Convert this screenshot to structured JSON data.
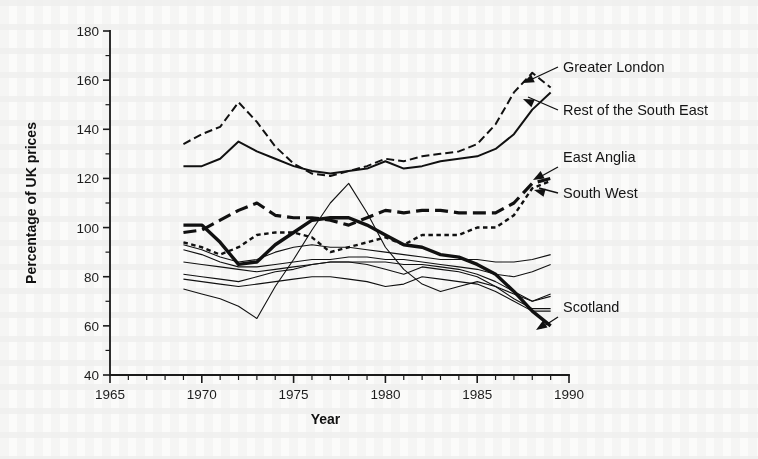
{
  "figure": {
    "background_color": "#fbfbfa",
    "ink_color": "#111111"
  },
  "axes": {
    "x_title": "Year",
    "y_title": "Percentage of UK prices",
    "x_tick_labels": [
      "1965",
      "1970",
      "1975",
      "1980",
      "1985",
      "1990"
    ],
    "y_tick_labels": [
      "40",
      "60",
      "80",
      "100",
      "120",
      "140",
      "160",
      "180"
    ]
  },
  "annotations": [
    {
      "id": "greater-london",
      "text": "Greater London"
    },
    {
      "id": "rest-of-the-south-east",
      "text": "Rest of the South East"
    },
    {
      "id": "east-anglia",
      "text": "East Anglia"
    },
    {
      "id": "south-west",
      "text": "South West"
    },
    {
      "id": "scotland",
      "text": "Scotland"
    }
  ],
  "chart_data": {
    "type": "line",
    "title": "",
    "xlabel": "Year",
    "ylabel": "Percentage of UK prices",
    "xlim": [
      1965,
      1990
    ],
    "ylim": [
      40,
      180
    ],
    "x_major_ticks": [
      1965,
      1970,
      1975,
      1980,
      1985,
      1990
    ],
    "x_minor_tick_step": 1,
    "y_major_ticks": [
      40,
      60,
      80,
      100,
      120,
      140,
      160,
      180
    ],
    "y_minor_tick_step": 10,
    "grid": false,
    "legend": "inline-annotations-right",
    "x": [
      1969,
      1970,
      1971,
      1972,
      1973,
      1974,
      1975,
      1976,
      1977,
      1978,
      1979,
      1980,
      1981,
      1982,
      1983,
      1984,
      1985,
      1986,
      1987,
      1988,
      1989
    ],
    "series": [
      {
        "name": "Greater London",
        "style": "dashed",
        "width": 2.0,
        "labelled": true,
        "values": [
          134,
          138,
          141,
          151,
          143,
          133,
          126,
          122,
          121,
          123,
          125,
          128,
          127,
          129,
          130,
          131,
          134,
          142,
          155,
          163,
          157
        ]
      },
      {
        "name": "Rest of the South East",
        "style": "solid",
        "width": 2.0,
        "labelled": true,
        "values": [
          125,
          125,
          128,
          135,
          131,
          128,
          125,
          123,
          122,
          123,
          124,
          127,
          124,
          125,
          127,
          128,
          129,
          132,
          138,
          148,
          155
        ]
      },
      {
        "name": "East Anglia",
        "style": "long-dash",
        "width": 3.2,
        "labelled": true,
        "values": [
          98,
          99,
          103,
          107,
          110,
          105,
          104,
          104,
          103,
          101,
          104,
          107,
          106,
          107,
          107,
          106,
          106,
          106,
          110,
          118,
          120
        ]
      },
      {
        "name": "South West",
        "style": "short-dash",
        "width": 2.4,
        "labelled": true,
        "values": [
          94,
          92,
          89,
          92,
          97,
          98,
          98,
          96,
          90,
          92,
          94,
          96,
          93,
          97,
          97,
          97,
          100,
          100,
          105,
          116,
          119
        ]
      },
      {
        "name": "Scotland",
        "style": "solid",
        "width": 3.4,
        "labelled": true,
        "values": [
          101,
          101,
          94,
          85,
          86,
          93,
          98,
          103,
          104,
          104,
          101,
          97,
          93,
          92,
          89,
          88,
          85,
          81,
          74,
          66,
          60
        ]
      },
      {
        "name": "unlabelled-1",
        "style": "solid",
        "width": 1.1,
        "labelled": false,
        "values": [
          93,
          91,
          88,
          86,
          87,
          90,
          92,
          93,
          92,
          92,
          91,
          90,
          89,
          88,
          87,
          87,
          87,
          86,
          86,
          87,
          89
        ]
      },
      {
        "name": "unlabelled-2",
        "style": "solid",
        "width": 1.1,
        "labelled": false,
        "values": [
          91,
          89,
          86,
          84,
          84,
          85,
          86,
          87,
          87,
          88,
          88,
          87,
          87,
          86,
          85,
          84,
          83,
          81,
          80,
          82,
          85
        ]
      },
      {
        "name": "unlabelled-3",
        "style": "solid",
        "width": 1.1,
        "labelled": false,
        "values": [
          86,
          85,
          84,
          83,
          82,
          83,
          84,
          85,
          86,
          86,
          86,
          86,
          85,
          85,
          84,
          83,
          81,
          78,
          74,
          70,
          72
        ]
      },
      {
        "name": "unlabelled-4",
        "style": "solid",
        "width": 1.1,
        "labelled": false,
        "values": [
          81,
          80,
          79,
          78,
          80,
          82,
          83,
          85,
          86,
          86,
          85,
          83,
          81,
          84,
          83,
          82,
          80,
          76,
          71,
          67,
          67
        ]
      },
      {
        "name": "unlabelled-5",
        "style": "solid",
        "width": 1.1,
        "labelled": false,
        "values": [
          79,
          78,
          77,
          76,
          77,
          78,
          79,
          80,
          80,
          79,
          78,
          76,
          77,
          80,
          79,
          78,
          77,
          74,
          70,
          66,
          66
        ]
      },
      {
        "name": "unlabelled-6",
        "style": "solid",
        "width": 1.1,
        "labelled": false,
        "values": [
          75,
          73,
          71,
          68,
          63,
          76,
          87,
          99,
          110,
          118,
          106,
          92,
          83,
          77,
          74,
          76,
          78,
          76,
          73,
          70,
          73
        ]
      }
    ]
  }
}
